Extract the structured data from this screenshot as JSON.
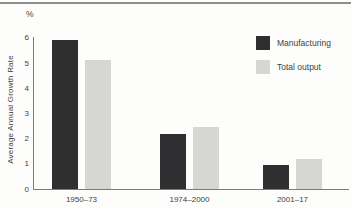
{
  "page": {
    "background_color": "#fdfdfb",
    "top_rule_color": "#8e8e8e"
  },
  "chart_data": {
    "type": "bar",
    "title": "",
    "ylabel": "Average Annual Growth Rate",
    "y_unit": "%",
    "xlabel": "",
    "categories": [
      "1950–73",
      "1974–2000",
      "2001–17"
    ],
    "series": [
      {
        "name": "Manufacturing",
        "color": "#2f2f32",
        "values": [
          5.9,
          2.2,
          0.95
        ]
      },
      {
        "name": "Total output",
        "color": "#d6d6d3",
        "values": [
          5.1,
          2.45,
          1.2
        ]
      }
    ],
    "ylim": [
      0,
      6
    ],
    "yticks": [
      0,
      1,
      2,
      3,
      4,
      5,
      6
    ],
    "grid": false,
    "legend_position": "top-right",
    "axis_color": "#7a7a7a",
    "text_color": "#3f3f3f"
  }
}
